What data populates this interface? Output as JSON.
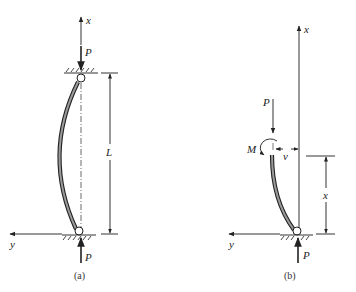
{
  "figure": {
    "panels": [
      {
        "id": "a",
        "caption": "(a)",
        "labels": {
          "x_axis": "x",
          "y_axis": "y",
          "load_top": "P",
          "load_bottom": "P",
          "length": "L"
        }
      },
      {
        "id": "b",
        "caption": "(b)",
        "labels": {
          "x_axis": "x",
          "y_axis": "y",
          "load_top": "P",
          "load_bottom": "P",
          "moment": "M",
          "deflection": "v",
          "position": "x"
        }
      }
    ]
  }
}
